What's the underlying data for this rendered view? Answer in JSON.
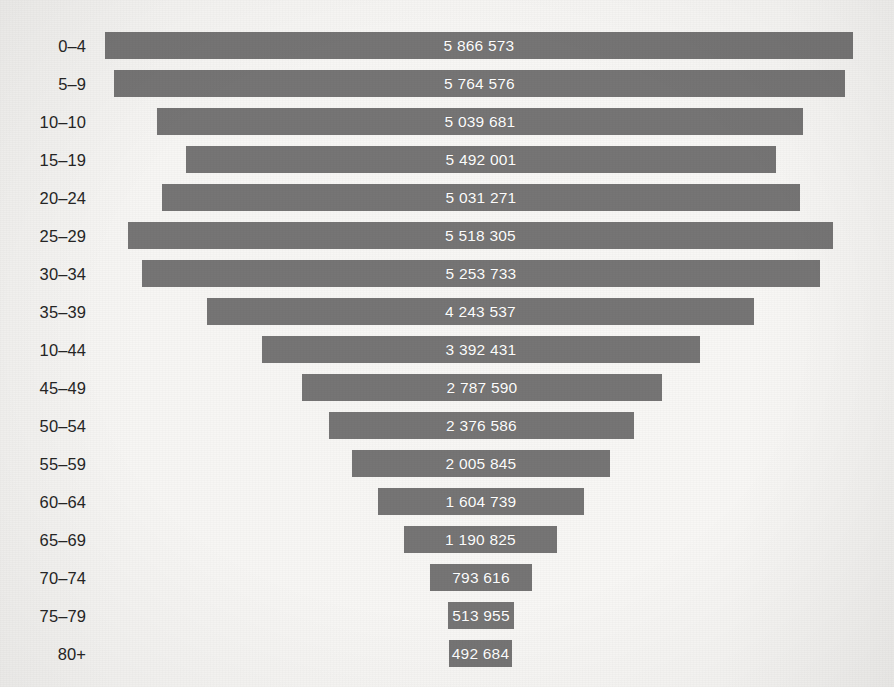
{
  "chart_data": {
    "type": "bar",
    "orientation": "horizontal-centered",
    "title": "",
    "subtitle": "",
    "xlabel": "",
    "ylabel": "",
    "grid": false,
    "legend": null,
    "axis_center_x_px": 481,
    "bar_color": "#767575",
    "background_color": "#f6f5f3",
    "value_label_color": "#ffffff",
    "category_label_color": "#262626",
    "value_scale_px_per_unit": 0.0001256,
    "xlim": [
      0,
      6000000
    ],
    "categories": [
      "0–4",
      "5–9",
      "10–10",
      "15–19",
      "20–24",
      "25–29",
      "30–34",
      "35–39",
      "10–44",
      "45–49",
      "50–54",
      "55–59",
      "60–64",
      "65–69",
      "70–74",
      "75–79",
      "80+"
    ],
    "values": [
      5866573,
      5764576,
      5039681,
      5492001,
      5031271,
      5518305,
      5253733,
      4243537,
      3392431,
      2787590,
      2376586,
      2005845,
      1604739,
      1190825,
      793616,
      513955,
      492684
    ],
    "value_labels": [
      "5 866 573",
      "5 764 576",
      "5 039 681",
      "5 492 001",
      "5 031 271",
      "5 518 305",
      "5 253 733",
      "4 243 537",
      "3 392 431",
      "2 787 590",
      "2 005 845",
      "1 604 739",
      "1 190 825",
      "793 616",
      "513 955",
      "492 684"
    ],
    "bars": [
      {
        "label": "0–4",
        "value": 5866573,
        "value_label": "5 866 573",
        "left_px": 105,
        "right_px": 853,
        "top_px": 32
      },
      {
        "label": "5–9",
        "value": 5764576,
        "value_label": "5 764 576",
        "left_px": 114,
        "right_px": 845,
        "top_px": 70
      },
      {
        "label": "10–10",
        "value": 5039681,
        "value_label": "5 039 681",
        "left_px": 157,
        "right_px": 803,
        "top_px": 108
      },
      {
        "label": "15–19",
        "value": 5492001,
        "value_label": "5 492 001",
        "left_px": 186,
        "right_px": 776,
        "top_px": 146
      },
      {
        "label": "20–24",
        "value": 5031271,
        "value_label": "5 031 271",
        "left_px": 162,
        "right_px": 800,
        "top_px": 184
      },
      {
        "label": "25–29",
        "value": 5518305,
        "value_label": "5 518 305",
        "left_px": 128,
        "right_px": 833,
        "top_px": 222
      },
      {
        "label": "30–34",
        "value": 5253733,
        "value_label": "5 253 733",
        "left_px": 142,
        "right_px": 820,
        "top_px": 260
      },
      {
        "label": "35–39",
        "value": 4243537,
        "value_label": "4 243 537",
        "left_px": 207,
        "right_px": 754,
        "top_px": 298
      },
      {
        "label": "10–44",
        "value": 3392431,
        "value_label": "3 392 431",
        "left_px": 262,
        "right_px": 700,
        "top_px": 336
      },
      {
        "label": "45–49",
        "value": 2787590,
        "value_label": "2 787 590",
        "left_px": 302,
        "right_px": 662,
        "top_px": 374
      },
      {
        "label": "50–54",
        "value": 2376586,
        "value_label": "2 376 586",
        "left_px": 329,
        "right_px": 634,
        "top_px": 412
      },
      {
        "label": "55–59",
        "value": 2005845,
        "value_label": "2 005 845",
        "left_px": 352,
        "right_px": 610,
        "top_px": 450
      },
      {
        "label": "60–64",
        "value": 1604739,
        "value_label": "1 604 739",
        "left_px": 378,
        "right_px": 584,
        "top_px": 488
      },
      {
        "label": "65–69",
        "value": 1190825,
        "value_label": "1 190 825",
        "left_px": 404,
        "right_px": 557,
        "top_px": 526
      },
      {
        "label": "70–74",
        "value": 793616,
        "value_label": "793 616",
        "left_px": 430,
        "right_px": 532,
        "top_px": 564
      },
      {
        "label": "75–79",
        "value": 513955,
        "value_label": "513 955",
        "left_px": 448,
        "right_px": 514,
        "top_px": 602
      },
      {
        "label": "80+",
        "value": 492684,
        "value_label": "492 684",
        "left_px": 449,
        "right_px": 512,
        "top_px": 640
      }
    ]
  }
}
